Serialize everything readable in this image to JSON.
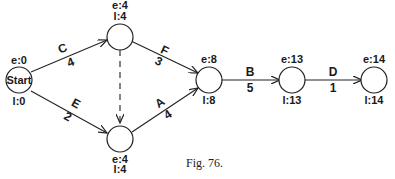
{
  "caption": "Fig. 76.",
  "nodes": [
    {
      "id": "start",
      "label": "Start",
      "e": "e:0",
      "l": "l:0"
    },
    {
      "id": "n2",
      "label": "",
      "e": "e:4",
      "l": "l:4"
    },
    {
      "id": "n3",
      "label": "",
      "e": "e:4",
      "l": "l:4"
    },
    {
      "id": "n4",
      "label": "",
      "e": "e:8",
      "l": "l:8"
    },
    {
      "id": "n5",
      "label": "",
      "e": "e:13",
      "l": "l:13"
    },
    {
      "id": "n6",
      "label": "",
      "e": "e:14",
      "l": "l:14"
    }
  ],
  "activities": [
    {
      "name": "C",
      "duration": "4",
      "from": "start",
      "to": "n2"
    },
    {
      "name": "E",
      "duration": "2",
      "from": "start",
      "to": "n3"
    },
    {
      "name": "F",
      "duration": "3",
      "from": "n2",
      "to": "n4"
    },
    {
      "name": "A",
      "duration": "4",
      "from": "n3",
      "to": "n4"
    },
    {
      "name": "B",
      "duration": "5",
      "from": "n4",
      "to": "n5"
    },
    {
      "name": "D",
      "duration": "1",
      "from": "n5",
      "to": "n6"
    },
    {
      "name": "dummy",
      "duration": "",
      "from": "n2",
      "to": "n3",
      "dashed": true
    }
  ]
}
